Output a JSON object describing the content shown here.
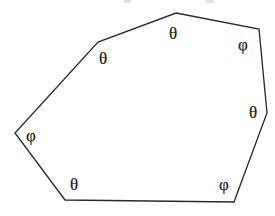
{
  "figure": {
    "type": "polygon-angle-diagram",
    "shape_name": "octagon",
    "vertex_count": 8,
    "background_color": "#ffffff",
    "stroke_color": "#2b2b2b",
    "label_color": "#242424",
    "canvas": {
      "width": 275,
      "height": 216
    },
    "vertices": [
      {
        "id": "v-top-apex",
        "x": 176,
        "y": 13,
        "label": "θ",
        "label_name": "theta",
        "label_x": 173,
        "label_y": 33
      },
      {
        "id": "v-upper-right",
        "x": 259,
        "y": 29,
        "label": "φ",
        "label_name": "phi",
        "label_x": 243,
        "label_y": 44
      },
      {
        "id": "v-right",
        "x": 267,
        "y": 113,
        "label": "θ",
        "label_name": "theta",
        "label_x": 253,
        "label_y": 112
      },
      {
        "id": "v-lower-right",
        "x": 234,
        "y": 202,
        "label": "φ",
        "label_name": "phi",
        "label_x": 224,
        "label_y": 184
      },
      {
        "id": "v-lower-left",
        "x": 65,
        "y": 200,
        "label": "θ",
        "label_name": "theta",
        "label_x": 74,
        "label_y": 184
      },
      {
        "id": "v-left",
        "x": 15,
        "y": 133,
        "label": "φ",
        "label_name": "phi",
        "label_x": 31,
        "label_y": 135
      },
      {
        "id": "v-upper-left",
        "x": 98,
        "y": 42,
        "label": "θ",
        "label_name": "theta",
        "label_x": 103,
        "label_y": 58
      }
    ],
    "polygon_points": "176,13 259,29 267,113 234,202 65,200 15,133 98,42",
    "symbols_used": [
      {
        "glyph": "θ",
        "name": "theta",
        "count": 4
      },
      {
        "glyph": "φ",
        "name": "phi",
        "count": 3
      }
    ],
    "artifacts": [
      {
        "id": "artifact-top-left",
        "x": 124,
        "y": 0,
        "width": 7,
        "height": 3
      },
      {
        "id": "artifact-top-right",
        "x": 206,
        "y": 0,
        "width": 8,
        "height": 3
      }
    ]
  }
}
